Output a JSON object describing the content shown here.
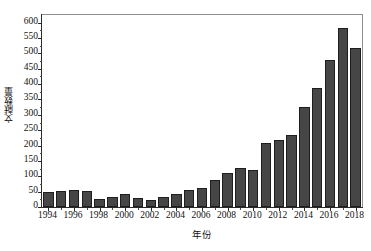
{
  "chart_data": {
    "type": "bar",
    "title": "",
    "xlabel": "年份",
    "ylabel": "文献数量",
    "categories": [
      "1994",
      "1995",
      "1996",
      "1997",
      "1998",
      "1999",
      "2000",
      "2001",
      "2002",
      "2003",
      "2004",
      "2005",
      "2006",
      "2007",
      "2008",
      "2009",
      "2010",
      "2011",
      "2012",
      "2013",
      "2014",
      "2015",
      "2016",
      "2017",
      "2018"
    ],
    "values": [
      48,
      52,
      55,
      52,
      27,
      32,
      42,
      29,
      22,
      34,
      42,
      55,
      61,
      87,
      110,
      126,
      121,
      207,
      219,
      235,
      327,
      386,
      479,
      583,
      519
    ],
    "ylim": [
      0,
      625
    ],
    "ytick_values": [
      0,
      50,
      100,
      150,
      200,
      250,
      300,
      350,
      400,
      450,
      500,
      550,
      600
    ],
    "ytick_labels": [
      "0",
      "50",
      "100",
      "150",
      "200",
      "250",
      "300",
      "350",
      "400",
      "450",
      "500",
      "550",
      "600"
    ],
    "xtick_labels": [
      "1994",
      "1996",
      "1998",
      "2000",
      "2002",
      "2004",
      "2006",
      "2008",
      "2010",
      "2012",
      "2014",
      "2016",
      "2018"
    ],
    "xtick_categories": [
      "1994",
      "1996",
      "1998",
      "2000",
      "2002",
      "2004",
      "2006",
      "2008",
      "2010",
      "2012",
      "2014",
      "2016",
      "2018"
    ],
    "grid": false,
    "legend": null,
    "legend_position": "none",
    "bar_color": "#464646",
    "bar_edge_color": "#1e1e1e",
    "axis_color": "#2a2a2a",
    "frame_color": "#8f8f8f",
    "background_color": "#ffffff"
  }
}
